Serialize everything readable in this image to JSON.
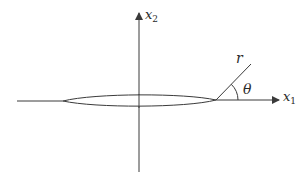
{
  "diagram": {
    "type": "crack-tip coordinate system",
    "labels": {
      "x1": {
        "main": "x",
        "sub": "1"
      },
      "x2": {
        "main": "x",
        "sub": "2"
      },
      "r": "r",
      "theta": "θ"
    },
    "colors": {
      "stroke": "#3a3a3a",
      "text": "#2a2a2a",
      "background": "#ffffff"
    }
  }
}
